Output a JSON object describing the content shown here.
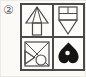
{
  "figure": {
    "label": "②",
    "colors": {
      "background": "#fbfaf6",
      "line": "#4a4a4a",
      "solid_shape": "#141414"
    },
    "grid": {
      "rows": 2,
      "cols": 2,
      "cells": [
        {
          "name": "up-arrow-figure"
        },
        {
          "name": "split-square-down-triangle-figure"
        },
        {
          "name": "square-triangle-circle-figure"
        },
        {
          "name": "inverted-heart-figure"
        }
      ]
    }
  }
}
